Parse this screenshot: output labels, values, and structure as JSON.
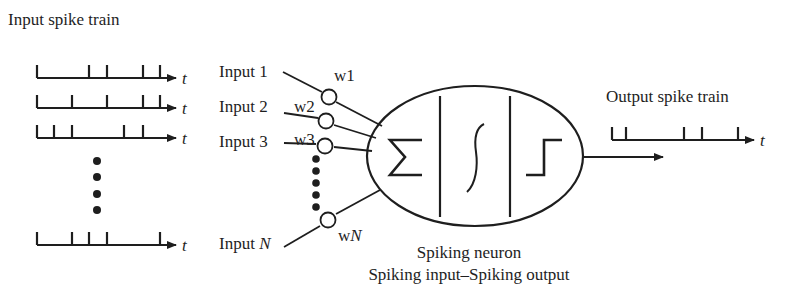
{
  "title": "Input spike train",
  "time_symbol": "t",
  "input_trains": [
    {
      "name": "train-1",
      "y": 78,
      "spikes": [
        37,
        89,
        107,
        143,
        160
      ]
    },
    {
      "name": "train-2",
      "y": 108,
      "spikes": [
        37,
        72,
        107,
        143,
        160
      ]
    },
    {
      "name": "train-3",
      "y": 138,
      "spikes": [
        37,
        54,
        72,
        124,
        143
      ]
    },
    {
      "name": "train-N",
      "y": 245,
      "spikes": [
        37,
        72,
        89,
        107,
        160
      ]
    }
  ],
  "inputs": [
    {
      "label": "Input 1",
      "weight": "w1"
    },
    {
      "label": "Input 2",
      "weight": "w2"
    },
    {
      "label": "Input 3",
      "weight": "w3"
    },
    {
      "label": "Input ",
      "label_italic": "N",
      "weight": "w",
      "weight_italic": "N"
    }
  ],
  "neuron": {
    "stages": [
      "summation",
      "sigmoid",
      "step"
    ],
    "label": "Spiking neuron",
    "subtitle": "Spiking input–Spiking output"
  },
  "output": {
    "title": "Output spike train",
    "spikes": [
      612,
      626,
      684,
      702,
      738
    ]
  },
  "colors": {
    "ink": "#1e1e1e",
    "background": "#ffffff"
  }
}
